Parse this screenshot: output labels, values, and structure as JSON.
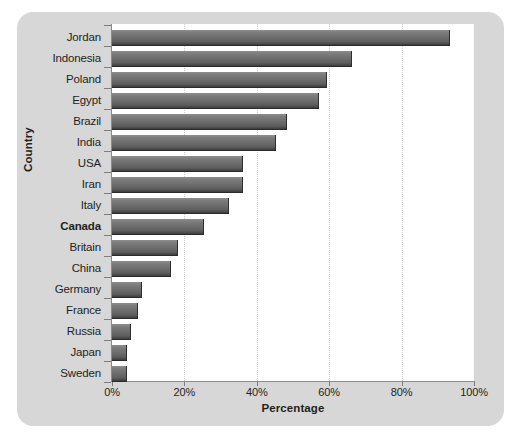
{
  "chart_data": {
    "type": "bar",
    "orientation": "horizontal",
    "title": "",
    "xlabel": "Percentage",
    "ylabel": "Country",
    "xlim": [
      0,
      100
    ],
    "xticks": [
      "0%",
      "20%",
      "40%",
      "60%",
      "80%",
      "100%"
    ],
    "xtick_values": [
      0,
      20,
      40,
      60,
      80,
      100
    ],
    "grid": "vertical-dotted",
    "legend": "none",
    "highlight_category": "Canada",
    "categories": [
      "Jordan",
      "Indonesia",
      "Poland",
      "Egypt",
      "Brazil",
      "India",
      "USA",
      "Iran",
      "Italy",
      "Canada",
      "Britain",
      "China",
      "Germany",
      "France",
      "Russia",
      "Japan",
      "Sweden"
    ],
    "values": [
      93,
      66,
      59,
      57,
      48,
      45,
      36,
      36,
      32,
      25,
      18,
      16,
      8,
      7,
      5,
      4,
      4
    ],
    "bars": [
      {
        "category": "Jordan",
        "value": 93,
        "bold": false
      },
      {
        "category": "Indonesia",
        "value": 66,
        "bold": false
      },
      {
        "category": "Poland",
        "value": 59,
        "bold": false
      },
      {
        "category": "Egypt",
        "value": 57,
        "bold": false
      },
      {
        "category": "Brazil",
        "value": 48,
        "bold": false
      },
      {
        "category": "India",
        "value": 45,
        "bold": false
      },
      {
        "category": "USA",
        "value": 36,
        "bold": false
      },
      {
        "category": "Iran",
        "value": 36,
        "bold": false
      },
      {
        "category": "Italy",
        "value": 32,
        "bold": false
      },
      {
        "category": "Canada",
        "value": 25,
        "bold": true
      },
      {
        "category": "Britain",
        "value": 18,
        "bold": false
      },
      {
        "category": "China",
        "value": 16,
        "bold": false
      },
      {
        "category": "Germany",
        "value": 8,
        "bold": false
      },
      {
        "category": "France",
        "value": 7,
        "bold": false
      },
      {
        "category": "Russia",
        "value": 5,
        "bold": false
      },
      {
        "category": "Japan",
        "value": 4,
        "bold": false
      },
      {
        "category": "Sweden",
        "value": 4,
        "bold": false
      }
    ],
    "colors": {
      "bar_top": "#8e8e8e",
      "bar_bottom": "#3c3c3c",
      "panel_background": "#d7d7d7",
      "plot_background": "#ffffff",
      "axis": "#8a8a8a",
      "gridline": "#d0d0d0",
      "text": "#231f20"
    }
  }
}
